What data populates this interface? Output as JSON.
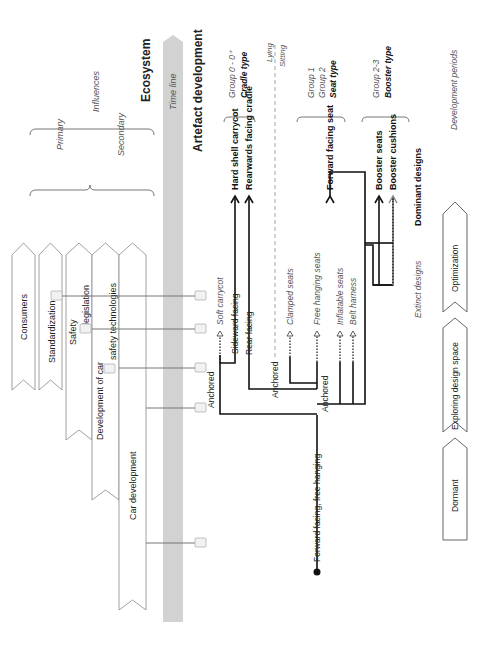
{
  "ecosystem": {
    "title": "Ecosystem",
    "influences_label": "Influences",
    "primary_label": "Primary",
    "secondary_label": "Secondary",
    "arrows": [
      {
        "label": "Consumers"
      },
      {
        "label": "Standardization"
      },
      {
        "label": "Safety",
        "label2": "legislation"
      },
      {
        "label": "Development of car",
        "label2": "safety technologies"
      },
      {
        "label": "Car development"
      }
    ]
  },
  "timeline": {
    "label": "Time line"
  },
  "artefact": {
    "title": "Artefact development",
    "groups": [
      {
        "group": "Group 0 - 0⁺",
        "type": "Cradle type"
      },
      {
        "group": "Group 1",
        "group2": "Group 2",
        "type": "Seat type"
      },
      {
        "group": "Group 2-3",
        "type": "Booster type"
      }
    ],
    "lying_label": "Lying",
    "sitting_label": "Sitting",
    "root": "Forward facing, free hanging",
    "branches": {
      "anchored_1": "Anchored",
      "anchored_2": "Anchored",
      "anchored_3": "Anchored",
      "soft_carrycot": "Soft carrycot",
      "sideward_facing": "Sideward facing",
      "rear_facing": "Rear facing",
      "clamped_seats": "Clamped seats",
      "free_hanging_seats": "Free hanging seats",
      "inflatable_seats": "Inflatable seats",
      "belt_harness": "Belt harness"
    },
    "dominant": {
      "hard_shell_carrycot": "Hard shell carrycot",
      "rearwards_facing_cradle": "Rearwards facing cradle",
      "forward_facing_seat": "Forward facing seat",
      "booster_seats": "Booster seats",
      "booster_cushions": "Booster cushions"
    }
  },
  "legend": {
    "extinct": "Extinct designs",
    "dominant": "Dominant designs"
  },
  "periods": {
    "title": "Development periods",
    "items": [
      "Dormant",
      "Exploring design space",
      "Optimization"
    ]
  }
}
